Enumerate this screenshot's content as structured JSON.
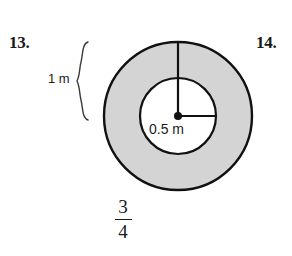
{
  "page": {
    "background_color": "#ffffff",
    "width": 292,
    "height": 256
  },
  "problems": {
    "left_number": "13.",
    "right_number": "14."
  },
  "figure": {
    "type": "annulus-diagram",
    "outer_circle": {
      "center_x": 178,
      "center_y": 116,
      "radius": 74,
      "stroke_color": "#111111",
      "stroke_width": 2.4,
      "fill_color": "#d4d4d4"
    },
    "inner_circle": {
      "center_x": 178,
      "center_y": 116,
      "radius": 38,
      "stroke_color": "#111111",
      "stroke_width": 2.2,
      "fill_color": "#ffffff"
    },
    "center_dot": {
      "x": 178,
      "y": 116,
      "radius": 4,
      "color": "#111111"
    },
    "vertical_radius_line": {
      "x1": 178,
      "y1": 42,
      "x2": 178,
      "y2": 116,
      "color": "#111111",
      "width": 2.2
    },
    "horizontal_radius_line": {
      "x1": 178,
      "y1": 116,
      "x2": 216,
      "y2": 116,
      "color": "#111111",
      "width": 2.2
    },
    "brace": {
      "x": 88,
      "top_y": 42,
      "bottom_y": 120,
      "color": "#3a3a3a",
      "width": 1.4
    },
    "labels": {
      "outer_radius": "1 m",
      "inner_radius": "0.5 m"
    }
  },
  "answer": {
    "numerator": "3",
    "denominator": "4"
  }
}
